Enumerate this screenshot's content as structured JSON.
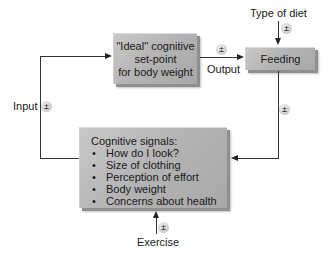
{
  "diagram": {
    "setpoint_box": {
      "lines": [
        "\"Ideal\" cognitive",
        "set-point",
        "for body weight"
      ]
    },
    "feeding_box": {
      "label": "Feeding"
    },
    "cognitive_box": {
      "title": "Cognitive signals:",
      "items": [
        "How do I look?",
        "Size of clothing",
        "Perception of effort",
        "Body weight",
        "Concerns about health"
      ]
    },
    "labels": {
      "type_of_diet": "Type of diet",
      "output": "Output",
      "input": "Input",
      "exercise": "Exercise"
    },
    "modulator_symbol": "±"
  }
}
